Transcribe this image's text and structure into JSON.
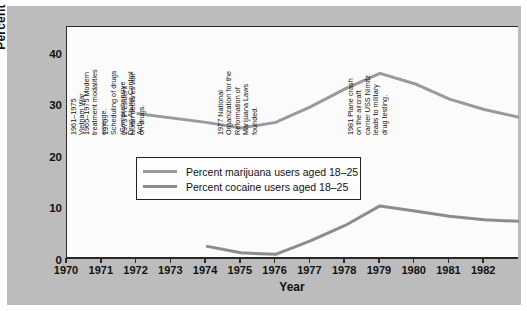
{
  "chart_data": {
    "type": "line",
    "title": "",
    "xlabel": "Year",
    "ylabel": "Percent Use",
    "xlim": [
      1970,
      1983
    ],
    "ylim": [
      0,
      45
    ],
    "yticks": [
      0,
      10,
      20,
      30,
      40
    ],
    "xticks": [
      1970,
      1971,
      1972,
      1973,
      1974,
      1975,
      1976,
      1977,
      1978,
      1979,
      1980,
      1981,
      1982
    ],
    "grid": false,
    "legend_position": "inside-left",
    "series": [
      {
        "name": "Percent marijuana users aged 18–25",
        "color": "#9a9a9a",
        "x": [
          1972,
          1974,
          1975,
          1976,
          1977,
          1978,
          1979,
          1980,
          1981,
          1982,
          1983
        ],
        "values": [
          28.2,
          26.5,
          25.4,
          26.5,
          29.5,
          33.0,
          36.0,
          34.0,
          31.0,
          29.0,
          27.5
        ]
      },
      {
        "name": "Percent cocaine users aged 18–25",
        "color": "#8c8c8c",
        "x": [
          1974,
          1975,
          1976,
          1977,
          1978,
          1979,
          1980,
          1981,
          1982,
          1983
        ],
        "values": [
          2.5,
          1.2,
          0.9,
          3.5,
          6.5,
          10.3,
          9.3,
          8.3,
          7.6,
          7.3
        ]
      }
    ],
    "annotations": [
      {
        "year": 1970.08,
        "lines": [
          "1961–1975",
          "Vietnam War"
        ]
      },
      {
        "year": 1970.45,
        "lines": [
          "1965–1975 Modern",
          "treatment modalities",
          "emerge."
        ]
      },
      {
        "year": 1971.02,
        "lines": [
          "1970",
          "Scheduling of drugs",
          "(Comprehensive",
          "Drug  Abuse Control",
          "Act)."
        ]
      },
      {
        "year": 1971.55,
        "lines": [
          "1973 President",
          "Nixon declares war",
          "on drugs."
        ]
      },
      {
        "year": 1974.3,
        "lines": [
          "1977 National",
          "Organization for the",
          "Reformation of",
          "Marijuana Laws",
          "founded."
        ]
      },
      {
        "year": 1978.05,
        "lines": [
          "1981 Plane crash",
          "on the aircraft",
          "carrier USS Nimitz",
          "leads to military",
          "drug testing."
        ]
      }
    ]
  },
  "legend": {
    "items": [
      {
        "label": "Percent marijuana users aged 18–25",
        "color": "#9a9a9a"
      },
      {
        "label": "Percent cocaine users aged 18–25",
        "color": "#8c8c8c"
      }
    ]
  },
  "colors": {
    "marijuana_line": "#9a9a9a",
    "cocaine_line": "#8c8c8c",
    "axis": "#2a2a2a",
    "plot_background": "#fbfbfb",
    "figure_background": "#bcbcbc"
  }
}
